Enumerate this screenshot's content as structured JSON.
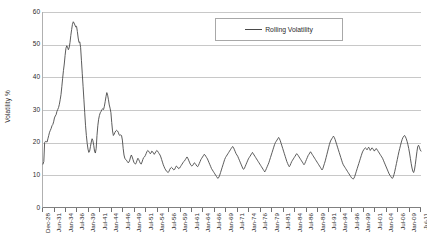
{
  "chart_data": {
    "type": "line",
    "title": "",
    "subtitle": "",
    "xlabel": "",
    "ylabel": "Volatility %",
    "ylim": [
      0,
      60
    ],
    "ytick_labels": [
      "60",
      "50",
      "40",
      "30",
      "20",
      "10",
      "0"
    ],
    "ytick_values": [
      60,
      50,
      40,
      30,
      20,
      10,
      0
    ],
    "grid": "horizontal",
    "legend_position": "top-right-inside",
    "legend": [
      "Rolling Volatility"
    ],
    "series_color": "#4a4a4a",
    "xtick_labels": [
      "Dec-28",
      "Jun-31",
      "Jan-34",
      "Jul-36",
      "Jan-39",
      "Jul-41",
      "Jan-44",
      "Jul-46",
      "Jan-49",
      "Jul-51",
      "Jan-54",
      "Jul-56",
      "Jan-59",
      "Jul-61",
      "Jan-64",
      "Jul-66",
      "Jan-69",
      "Jul-71",
      "Jan-74",
      "Jul-76",
      "Jan-79",
      "Jul-81",
      "Jan-84",
      "Jul-86",
      "Jan-89",
      "Jul-91",
      "Jan-94",
      "Jul-96",
      "Jan-99",
      "Jul-01",
      "Jan-04",
      "Jul-06",
      "Jan-09",
      "Jul-11"
    ],
    "x_start": "Dec-28",
    "x_end": "Jul-11",
    "series": [
      {
        "name": "Rolling Volatility",
        "values": [
          13.2,
          14.0,
          19.8,
          20.2,
          20.1,
          20.0,
          21.0,
          22.0,
          23.0,
          23.6,
          24.2,
          25.0,
          25.4,
          26.2,
          27.4,
          28.0,
          28.4,
          29.4,
          30.0,
          30.6,
          31.6,
          33.0,
          34.6,
          37.0,
          39.6,
          42.0,
          44.0,
          46.6,
          48.8,
          49.6,
          49.2,
          48.4,
          49.0,
          50.6,
          52.8,
          54.6,
          56.2,
          57.0,
          56.6,
          56.0,
          55.4,
          55.6,
          54.0,
          52.0,
          50.6,
          50.8,
          49.0,
          45.0,
          41.0,
          37.0,
          33.0,
          29.0,
          25.0,
          22.0,
          19.6,
          17.8,
          16.8,
          17.2,
          18.6,
          20.0,
          21.0,
          20.4,
          19.0,
          17.2,
          16.6,
          18.0,
          22.0,
          25.0,
          27.0,
          28.2,
          29.0,
          29.4,
          30.0,
          30.2,
          30.0,
          31.0,
          32.4,
          34.0,
          35.2,
          34.4,
          33.0,
          31.4,
          30.4,
          29.0,
          26.0,
          23.4,
          22.0,
          22.4,
          23.0,
          23.4,
          23.6,
          23.4,
          23.0,
          22.2,
          22.0,
          22.2,
          22.0,
          20.6,
          18.0,
          16.0,
          15.0,
          14.6,
          14.4,
          14.0,
          13.6,
          13.8,
          14.4,
          15.4,
          16.0,
          15.4,
          14.6,
          13.8,
          13.4,
          13.2,
          13.6,
          14.4,
          15.0,
          14.6,
          14.0,
          13.4,
          13.2,
          13.8,
          14.6,
          15.2,
          15.4,
          15.8,
          16.4,
          17.0,
          17.4,
          17.2,
          16.8,
          16.4,
          16.6,
          17.2,
          17.0,
          16.6,
          16.2,
          16.6,
          17.0,
          17.4,
          17.2,
          16.8,
          16.4,
          16.0,
          15.4,
          14.6,
          13.8,
          13.0,
          12.4,
          11.8,
          11.4,
          11.0,
          10.8,
          10.6,
          11.0,
          11.6,
          12.0,
          12.2,
          12.0,
          11.6,
          11.4,
          11.6,
          12.2,
          12.6,
          12.4,
          12.0,
          11.8,
          12.0,
          12.4,
          12.8,
          13.2,
          13.6,
          14.0,
          14.2,
          14.6,
          15.0,
          15.4,
          15.0,
          14.4,
          13.8,
          13.2,
          12.8,
          12.6,
          12.8,
          13.2,
          13.6,
          13.4,
          13.0,
          12.6,
          12.4,
          12.8,
          13.4,
          14.0,
          14.6,
          15.0,
          15.4,
          15.8,
          16.2,
          16.0,
          15.6,
          15.2,
          14.8,
          14.2,
          13.6,
          13.0,
          12.4,
          11.8,
          11.4,
          11.0,
          10.6,
          10.2,
          9.8,
          9.4,
          9.0,
          8.8,
          9.2,
          9.8,
          10.6,
          11.4,
          12.2,
          13.0,
          13.8,
          14.6,
          15.2,
          15.6,
          16.0,
          16.4,
          16.8,
          17.2,
          17.6,
          18.0,
          18.4,
          18.6,
          18.2,
          17.6,
          17.0,
          16.4,
          16.0,
          15.6,
          15.0,
          14.4,
          13.8,
          13.2,
          12.6,
          12.0,
          11.6,
          11.8,
          12.4,
          13.0,
          13.6,
          14.2,
          14.8,
          15.2,
          15.6,
          16.0,
          16.4,
          16.8,
          16.4,
          16.0,
          15.6,
          15.2,
          14.8,
          14.4,
          14.0,
          13.6,
          13.2,
          12.8,
          12.4,
          12.0,
          11.6,
          11.2,
          10.8,
          11.2,
          11.8,
          12.4,
          13.0,
          13.6,
          14.4,
          15.2,
          16.0,
          16.8,
          17.6,
          18.4,
          19.2,
          19.8,
          20.2,
          20.6,
          21.0,
          21.4,
          21.0,
          20.4,
          19.6,
          18.8,
          18.0,
          17.2,
          16.4,
          15.6,
          14.8,
          14.0,
          13.4,
          12.8,
          12.4,
          12.8,
          13.4,
          14.0,
          14.4,
          14.8,
          15.2,
          15.6,
          16.0,
          16.4,
          16.2,
          15.8,
          15.4,
          15.0,
          14.6,
          14.2,
          13.8,
          13.4,
          13.0,
          13.4,
          14.0,
          14.6,
          15.2,
          15.8,
          16.2,
          16.6,
          17.0,
          16.6,
          16.2,
          15.8,
          15.4,
          15.0,
          14.6,
          14.2,
          13.8,
          13.4,
          13.0,
          12.6,
          12.2,
          11.8,
          11.4,
          11.8,
          12.6,
          13.4,
          14.2,
          15.2,
          16.2,
          17.2,
          18.2,
          19.2,
          20.0,
          20.6,
          21.0,
          21.4,
          21.8,
          21.4,
          20.8,
          20.0,
          19.2,
          18.4,
          17.6,
          16.8,
          16.0,
          15.2,
          14.4,
          13.6,
          13.0,
          12.6,
          12.2,
          11.8,
          11.4,
          11.0,
          10.6,
          10.2,
          9.8,
          9.4,
          9.0,
          8.8,
          8.6,
          8.8,
          9.4,
          10.2,
          11.0,
          11.8,
          12.6,
          13.4,
          14.2,
          15.0,
          15.8,
          16.6,
          17.2,
          17.6,
          18.0,
          18.2,
          18.0,
          17.6,
          18.0,
          18.4,
          18.0,
          17.4,
          17.8,
          18.2,
          18.0,
          17.6,
          17.2,
          17.6,
          18.0,
          17.8,
          17.4,
          17.0,
          16.6,
          16.2,
          15.8,
          15.4,
          15.0,
          14.4,
          13.8,
          13.2,
          12.6,
          12.0,
          11.4,
          10.8,
          10.2,
          9.8,
          9.4,
          9.0,
          8.8,
          9.2,
          10.0,
          11.0,
          12.2,
          13.4,
          14.6,
          15.8,
          17.0,
          18.0,
          19.0,
          20.0,
          20.8,
          21.4,
          21.8,
          22.0,
          21.6,
          21.0,
          20.2,
          19.2,
          18.0,
          16.6,
          15.0,
          13.4,
          12.0,
          11.0,
          10.6,
          11.4,
          13.0,
          15.0,
          17.0,
          18.6,
          19.0,
          18.4,
          17.6,
          17.2
        ]
      }
    ]
  },
  "axes": {
    "y_title": "Volatility %"
  },
  "legend": {
    "entries": [
      {
        "label": "Rolling Volatility",
        "swatch": "line-swatch"
      }
    ]
  }
}
